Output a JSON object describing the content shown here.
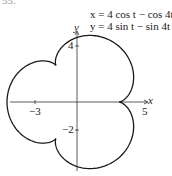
{
  "figure": {
    "clipped_label": "55."
  },
  "chart_data": {
    "type": "line",
    "title": "",
    "equations": [
      "x = 4 cos t − cos 4t",
      "y = 4 sin t − sin 4t"
    ],
    "parametric": {
      "x": "4*cos(t) - cos(4*t)",
      "y": "4*sin(t) - sin(4*t)",
      "t_range": [
        0,
        6.2832
      ]
    },
    "xlabel": "x",
    "ylabel": "y",
    "x_ticks": [
      {
        "value": -3,
        "label": "−3"
      },
      {
        "value": 5,
        "label": "5"
      }
    ],
    "y_ticks": [
      {
        "value": 4,
        "label": "4"
      },
      {
        "value": -2,
        "label": "−2"
      }
    ],
    "xlim": [
      -5,
      5
    ],
    "ylim": [
      -5,
      5
    ],
    "grid": false,
    "legend": "none",
    "key_points": [
      {
        "name": "cusp",
        "x": 3,
        "y": 0
      },
      {
        "name": "cusp",
        "x": -1.5,
        "y": 2.6
      },
      {
        "name": "cusp",
        "x": -1.5,
        "y": -2.6
      },
      {
        "name": "leftmost",
        "x": -5,
        "y": 0
      }
    ],
    "line_color": "#1a1a1a"
  },
  "layout": {
    "origin_px": [
      77,
      102
    ],
    "scale_x": 14,
    "scale_y": 14
  }
}
